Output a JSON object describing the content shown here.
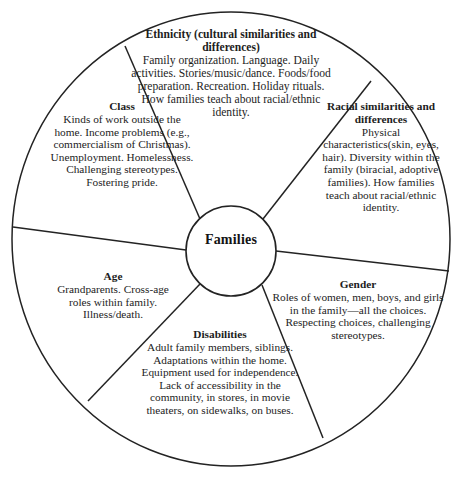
{
  "diagram": {
    "type": "wheel-diagram",
    "hub": {
      "label": "Families"
    },
    "stroke_color": "#232323",
    "text_color": "#1d1d1d",
    "background_color": "#ffffff",
    "segments": [
      {
        "id": "ethnicity",
        "heading": "Ethnicity (cultural similarities and differences)",
        "body": "Family organization. Language. Daily activities. Stories/music/dance. Foods/food preparation. Recreation. Holiday rituals. How families teach about racial/ethnic identity."
      },
      {
        "id": "racial",
        "heading": "Racial similarities and differences",
        "body": "Physical characteristics(skin, eyes, hair). Diversity within the family (biracial, adoptive families). How families teach about racial/ethnic identity."
      },
      {
        "id": "class",
        "heading": "Class",
        "body": "Kinds of work outside the home. Income problems (e.g., commercialism of Christmas). Unemployment. Homelessness. Challenging stereotypes. Fostering pride."
      },
      {
        "id": "age",
        "heading": "Age",
        "body": "Grandparents. Cross-age roles within family. Illness/death."
      },
      {
        "id": "disabilities",
        "heading": "Disabilities",
        "body": "Adult family members, siblings. Adaptations within the home. Equipment used for independence. Lack of accessibility in the community, in stores, in movie theaters, on sidewalks, on buses."
      },
      {
        "id": "gender",
        "heading": "Gender",
        "body": "Roles of women, men, boys, and girls in the family—all the choices. Respecting choices, challenging stereotypes."
      }
    ]
  }
}
